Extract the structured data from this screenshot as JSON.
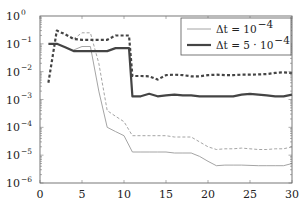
{
  "chart_data": {
    "type": "line",
    "title": "",
    "xlabel": "",
    "ylabel": "",
    "xlim": [
      0,
      30
    ],
    "ylim": [
      1e-06,
      1
    ],
    "yscale": "log",
    "grid": false,
    "legend_position": "upper right",
    "x_ticks": [
      0,
      5,
      10,
      15,
      20,
      25,
      30
    ],
    "y_ticks": [
      {
        "value": 1,
        "label": "10",
        "exp": "0"
      },
      {
        "value": 0.1,
        "label": "10",
        "exp": "−1"
      },
      {
        "value": 0.01,
        "label": "10",
        "exp": "−2"
      },
      {
        "value": 0.001,
        "label": "10",
        "exp": "−3"
      },
      {
        "value": 0.0001,
        "label": "10",
        "exp": "−4"
      },
      {
        "value": 1e-05,
        "label": "10",
        "exp": "−5"
      },
      {
        "value": 1e-06,
        "label": "10",
        "exp": "−6"
      }
    ],
    "legend": [
      {
        "label_prefix": "Δt = 10",
        "label_exp": "−4",
        "style": "thin-solid",
        "color": "#9a9a9a"
      },
      {
        "label_prefix": "Δt = 5 · 10",
        "label_exp": "−4",
        "style": "thick-solid",
        "color": "#444444"
      }
    ],
    "series": [
      {
        "name": "Δt = 1e-4 (solid)",
        "style": "thin-solid",
        "color": "#9a9a9a",
        "x": [
          4,
          5,
          6,
          7,
          8,
          9,
          10,
          11,
          12,
          13,
          14,
          15,
          16,
          17,
          18,
          19,
          20,
          21,
          22,
          23,
          24,
          25,
          26,
          27,
          28,
          29,
          30
        ],
        "y": [
          0.06,
          0.08,
          0.08,
          0.002,
          0.0001,
          7e-05,
          5e-05,
          1.3e-05,
          1.3e-05,
          1.3e-05,
          1.3e-05,
          1.3e-05,
          1.2e-05,
          1.2e-05,
          1.2e-05,
          9e-06,
          6e-06,
          4.2e-06,
          4.4e-06,
          4.4e-06,
          4.4e-06,
          4.3e-06,
          4.2e-06,
          4.2e-06,
          4.2e-06,
          4.2e-06,
          5e-06
        ]
      },
      {
        "name": "Δt = 1e-4 (dashed)",
        "style": "thin-dashed",
        "color": "#9a9a9a",
        "x": [
          4,
          5,
          6,
          7,
          8,
          9,
          10,
          11,
          12,
          13,
          14,
          15,
          16,
          17,
          18,
          19,
          20,
          21,
          22,
          23,
          24,
          25,
          26,
          27,
          28,
          29,
          30
        ],
        "y": [
          0.15,
          0.25,
          0.25,
          0.02,
          0.0004,
          0.00025,
          0.00016,
          5e-05,
          5e-05,
          5e-05,
          5e-05,
          5e-05,
          4.5e-05,
          4.5e-05,
          4.5e-05,
          3e-05,
          2e-05,
          1.6e-05,
          1.7e-05,
          1.7e-05,
          1.8e-05,
          1.7e-05,
          1.6e-05,
          1.6e-05,
          1.7e-05,
          1.7e-05,
          2e-05
        ]
      },
      {
        "name": "Δt = 5e-4 (solid)",
        "style": "thick-solid",
        "color": "#444444",
        "x": [
          1,
          2,
          3,
          4,
          5,
          6,
          7,
          8,
          9,
          10,
          10.6,
          11,
          12,
          13,
          14,
          15,
          16,
          17,
          18,
          19,
          20,
          21,
          22,
          23,
          24,
          25,
          26,
          27,
          28,
          29,
          30
        ],
        "y": [
          0.1,
          0.1,
          0.075,
          0.055,
          0.055,
          0.055,
          0.055,
          0.055,
          0.07,
          0.07,
          0.07,
          0.0013,
          0.0013,
          0.0016,
          0.0013,
          0.0014,
          0.0015,
          0.0014,
          0.0014,
          0.0013,
          0.0013,
          0.0013,
          0.0013,
          0.0013,
          0.0015,
          0.0016,
          0.0015,
          0.0014,
          0.0013,
          0.0013,
          0.0015
        ]
      },
      {
        "name": "Δt = 5e-4 (dashed)",
        "style": "thick-dashed",
        "color": "#444444",
        "x": [
          1,
          2,
          3,
          4,
          5,
          6,
          7,
          8,
          9,
          10,
          10.6,
          11,
          12,
          13,
          14,
          15,
          16,
          17,
          18,
          19,
          20,
          21,
          22,
          23,
          24,
          25,
          26,
          27,
          28,
          29,
          30
        ],
        "y": [
          0.004,
          0.3,
          0.22,
          0.15,
          0.14,
          0.14,
          0.14,
          0.14,
          0.2,
          0.2,
          0.2,
          0.007,
          0.007,
          0.0068,
          0.0052,
          0.0075,
          0.0078,
          0.0075,
          0.0068,
          0.0068,
          0.0075,
          0.0078,
          0.0075,
          0.0075,
          0.0078,
          0.0078,
          0.008,
          0.0082,
          0.009,
          0.0095,
          0.0088
        ]
      }
    ]
  },
  "plot_area": {
    "left": 40,
    "top": 16,
    "right": 292,
    "bottom": 183
  }
}
